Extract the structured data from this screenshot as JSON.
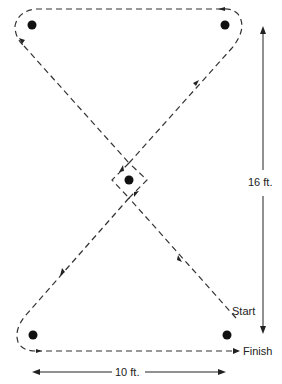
{
  "diagram": {
    "type": "figure-eight pylon course",
    "colors": {
      "line": "#333333",
      "pylon": "#111111",
      "background": "#ffffff"
    },
    "pylons": [
      {
        "id": "top-left",
        "x": 32,
        "y": 25
      },
      {
        "id": "top-right",
        "x": 225,
        "y": 25
      },
      {
        "id": "center",
        "x": 129,
        "y": 180
      },
      {
        "id": "bottom-left",
        "x": 33,
        "y": 335
      },
      {
        "id": "bottom-right",
        "x": 227,
        "y": 335
      }
    ],
    "labels": {
      "start": "Start",
      "finish": "Finish",
      "height_dimension": "16 ft.",
      "width_dimension": "10 ft."
    }
  }
}
